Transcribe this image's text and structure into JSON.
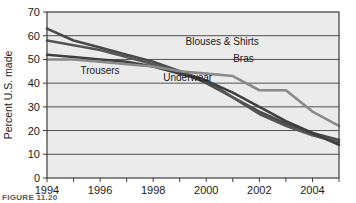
{
  "figure": {
    "caption": "FIGURE  11.20"
  },
  "chart_data": {
    "type": "line",
    "title": "",
    "xlabel": "",
    "ylabel": "Percent U.S. made",
    "xlim": [
      1994,
      2005
    ],
    "ylim": [
      0,
      70
    ],
    "grid": true,
    "legend_position": "inline-labels",
    "x": [
      1994,
      1995,
      1996,
      1997,
      1998,
      1999,
      2000,
      2001,
      2002,
      2003,
      2004,
      2005
    ],
    "xticks": [
      1994,
      1995,
      1996,
      1997,
      1998,
      1999,
      2000,
      2001,
      2002,
      2003,
      2004,
      2005
    ],
    "xticklabels": [
      "1994",
      "",
      "1996",
      "",
      "1998",
      "",
      "2000",
      "",
      "2002",
      "",
      "2004",
      ""
    ],
    "yticks": [
      0,
      10,
      20,
      30,
      40,
      50,
      60,
      70
    ],
    "yticklabels": [
      "0",
      "10",
      "20",
      "30",
      "40",
      "50",
      "60",
      "70"
    ],
    "series": [
      {
        "name": "Blouses & Shirts",
        "color": "#4a4a4a",
        "label_x": 2000.6,
        "label_y": 56,
        "values": [
          63,
          58,
          55,
          52,
          49,
          45,
          40,
          34,
          28,
          23,
          19,
          16
        ]
      },
      {
        "name": "Underwear",
        "color": "#555555",
        "label_x": 1999.3,
        "label_y": 41,
        "values": [
          58,
          56,
          54,
          51,
          48,
          45,
          41,
          34,
          27,
          22,
          18,
          15
        ]
      },
      {
        "name": "Trousers",
        "color": "#3f3f3f",
        "label_x": 1996.0,
        "label_y": 44,
        "values": [
          52,
          51,
          50,
          49,
          47,
          44,
          41,
          36,
          30,
          24,
          19,
          14
        ]
      },
      {
        "name": "Bras",
        "color": "#8a8a8a",
        "label_x": 2001.4,
        "label_y": 49,
        "values": [
          50,
          50,
          49,
          48,
          47,
          45,
          44,
          43,
          37,
          37,
          28,
          22
        ]
      }
    ]
  }
}
